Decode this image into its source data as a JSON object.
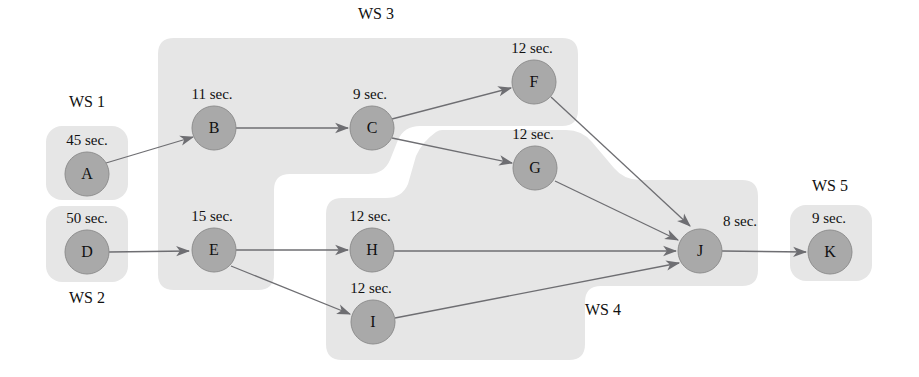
{
  "diagram": {
    "type": "precedence-network",
    "title": "",
    "colors": {
      "node_fill": "#a9a9a9",
      "region_fill": "#e6e6e6",
      "edge": "#6e6e72",
      "background": "#ffffff",
      "text": "#111111"
    },
    "workstations": [
      {
        "id": "WS1",
        "label": "WS 1",
        "label_x": 87,
        "label_y": 107,
        "tasks": [
          "A"
        ]
      },
      {
        "id": "WS2",
        "label": "WS 2",
        "label_x": 87,
        "label_y": 303,
        "tasks": [
          "D"
        ]
      },
      {
        "id": "WS3",
        "label": "WS 3",
        "label_x": 376,
        "label_y": 19,
        "tasks": [
          "B",
          "C",
          "E",
          "F"
        ]
      },
      {
        "id": "WS4",
        "label": "WS 4",
        "label_x": 603,
        "label_y": 315,
        "tasks": [
          "G",
          "H",
          "I",
          "J"
        ]
      },
      {
        "id": "WS5",
        "label": "WS 5",
        "label_x": 830,
        "label_y": 191,
        "tasks": [
          "K"
        ]
      }
    ],
    "nodes": [
      {
        "id": "A",
        "letter": "A",
        "time": "45 sec.",
        "seconds": 45,
        "x": 87,
        "y": 174,
        "r": 22,
        "label_x": 87,
        "label_y": 145
      },
      {
        "id": "B",
        "letter": "B",
        "time": "11 sec.",
        "seconds": 11,
        "x": 214,
        "y": 128,
        "r": 22,
        "label_x": 212,
        "label_y": 99
      },
      {
        "id": "C",
        "letter": "C",
        "time": "9 sec.",
        "seconds": 9,
        "x": 372,
        "y": 128,
        "r": 22,
        "label_x": 370,
        "label_y": 99
      },
      {
        "id": "D",
        "letter": "D",
        "time": "50 sec.",
        "seconds": 50,
        "x": 87,
        "y": 252,
        "r": 22,
        "label_x": 87,
        "label_y": 223
      },
      {
        "id": "E",
        "letter": "E",
        "time": "15 sec.",
        "seconds": 15,
        "x": 214,
        "y": 250,
        "r": 22,
        "label_x": 212,
        "label_y": 221
      },
      {
        "id": "F",
        "letter": "F",
        "time": "12 sec.",
        "seconds": 12,
        "x": 534,
        "y": 82,
        "r": 22,
        "label_x": 532,
        "label_y": 53
      },
      {
        "id": "G",
        "letter": "G",
        "time": "12 sec.",
        "seconds": 12,
        "x": 535,
        "y": 168,
        "r": 22,
        "label_x": 533,
        "label_y": 139
      },
      {
        "id": "H",
        "letter": "H",
        "time": "12 sec.",
        "seconds": 12,
        "x": 372,
        "y": 250,
        "r": 22,
        "label_x": 370,
        "label_y": 221
      },
      {
        "id": "I",
        "letter": "I",
        "time": "12 sec.",
        "seconds": 12,
        "x": 373,
        "y": 322,
        "r": 22,
        "label_x": 371,
        "label_y": 293
      },
      {
        "id": "J",
        "letter": "J",
        "time": "8 sec.",
        "seconds": 8,
        "x": 700,
        "y": 251,
        "r": 22,
        "label_x": 740,
        "label_y": 226
      },
      {
        "id": "K",
        "letter": "K",
        "time": "9 sec.",
        "seconds": 9,
        "x": 830,
        "y": 252,
        "r": 22,
        "label_x": 829,
        "label_y": 223
      }
    ],
    "edges": [
      {
        "from": "A",
        "to": "B"
      },
      {
        "from": "B",
        "to": "C"
      },
      {
        "from": "C",
        "to": "F"
      },
      {
        "from": "C",
        "to": "G"
      },
      {
        "from": "D",
        "to": "E"
      },
      {
        "from": "E",
        "to": "H"
      },
      {
        "from": "E",
        "to": "I"
      },
      {
        "from": "F",
        "to": "J"
      },
      {
        "from": "G",
        "to": "J"
      },
      {
        "from": "H",
        "to": "J"
      },
      {
        "from": "I",
        "to": "J"
      },
      {
        "from": "J",
        "to": "K"
      }
    ]
  }
}
